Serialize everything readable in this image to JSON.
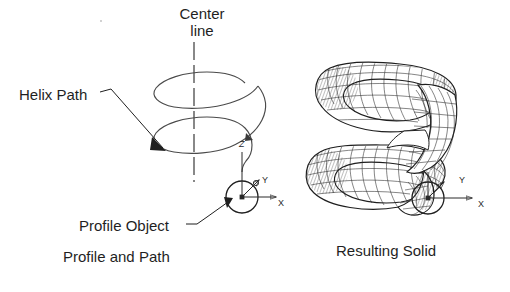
{
  "figure": {
    "background_color": "#ffffff",
    "line_color": "#1f1f1f",
    "mesh_color": "#2b2b2b"
  },
  "labels": {
    "center_line": "Center\nline",
    "helix_path": "Helix Path",
    "profile_object": "Profile Object"
  },
  "captions": {
    "left": "Profile and Path",
    "right": "Resulting Solid"
  },
  "axes": {
    "left_panel": {
      "z": "Z",
      "y": "Y",
      "x": "X"
    },
    "right_panel": {
      "y": "Y",
      "x": "X"
    }
  },
  "panels": [
    {
      "name": "profile-and-path",
      "caption": "Profile and Path",
      "elements": [
        "center-line",
        "helix-path",
        "profile-circle",
        "ucs-icon"
      ]
    },
    {
      "name": "resulting-solid",
      "caption": "Resulting Solid",
      "elements": [
        "coil-wireframe-solid",
        "profile-circle",
        "ucs-icon"
      ]
    }
  ]
}
